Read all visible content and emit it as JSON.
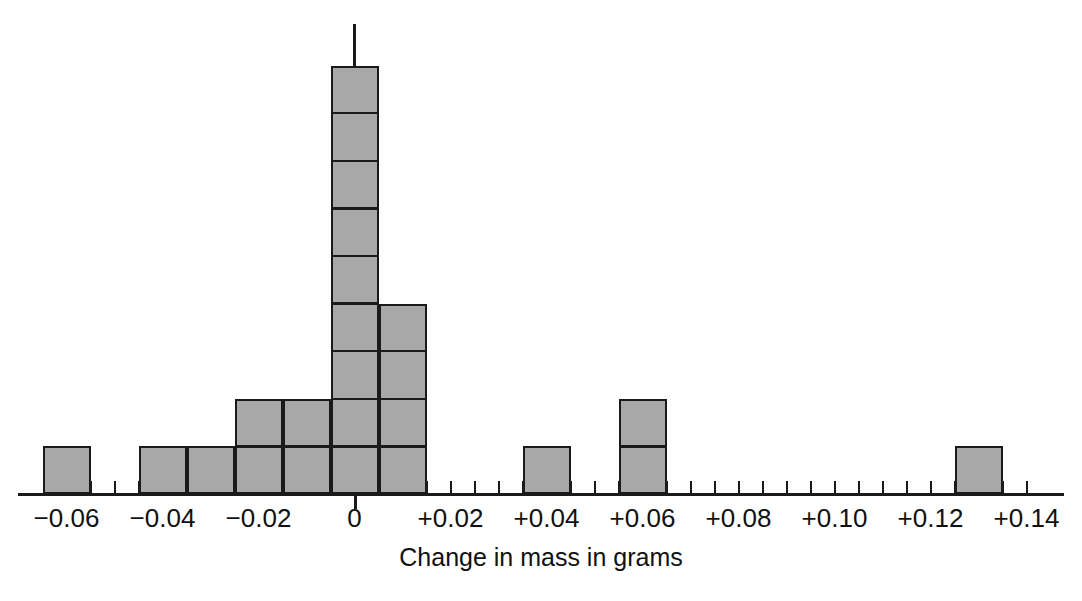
{
  "chart_data": {
    "type": "bar",
    "title": "",
    "xlabel": "Change in mass in grams",
    "ylabel": "",
    "grid": false,
    "legend": null,
    "bin_width": 0.01,
    "unit": "count",
    "xlim": [
      -0.07,
      0.145
    ],
    "ylim": [
      0,
      9
    ],
    "tick_values": [
      -0.06,
      -0.055,
      -0.05,
      -0.045,
      -0.04,
      -0.035,
      -0.03,
      -0.025,
      -0.02,
      -0.015,
      -0.01,
      -0.005,
      0,
      0.005,
      0.01,
      0.015,
      0.02,
      0.025,
      0.03,
      0.035,
      0.04,
      0.045,
      0.05,
      0.055,
      0.06,
      0.065,
      0.07,
      0.075,
      0.08,
      0.085,
      0.09,
      0.095,
      0.1,
      0.105,
      0.11,
      0.115,
      0.12,
      0.125,
      0.13,
      0.135,
      0.14
    ],
    "tick_labels": [
      {
        "value": -0.06,
        "text": "−0.06"
      },
      {
        "value": -0.04,
        "text": "−0.04"
      },
      {
        "value": -0.02,
        "text": "−0.02"
      },
      {
        "value": 0.0,
        "text": "0"
      },
      {
        "value": 0.02,
        "text": "+0.02"
      },
      {
        "value": 0.04,
        "text": "+0.04"
      },
      {
        "value": 0.06,
        "text": "+0.06"
      },
      {
        "value": 0.08,
        "text": "+0.08"
      },
      {
        "value": 0.1,
        "text": "+0.10"
      },
      {
        "value": 0.12,
        "text": "+0.12"
      },
      {
        "value": 0.14,
        "text": "+0.14"
      }
    ],
    "categories": [
      -0.06,
      -0.04,
      -0.03,
      -0.02,
      -0.01,
      0.0,
      0.01,
      0.04,
      0.06,
      0.13
    ],
    "values": [
      1,
      1,
      1,
      2,
      2,
      9,
      4,
      1,
      2,
      1
    ],
    "bars": [
      {
        "center": -0.06,
        "count": 1
      },
      {
        "center": -0.04,
        "count": 1
      },
      {
        "center": -0.03,
        "count": 1
      },
      {
        "center": -0.02,
        "count": 2
      },
      {
        "center": -0.01,
        "count": 2
      },
      {
        "center": 0.0,
        "count": 9
      },
      {
        "center": 0.01,
        "count": 4
      },
      {
        "center": 0.04,
        "count": 1
      },
      {
        "center": 0.06,
        "count": 2
      },
      {
        "center": 0.13,
        "count": 1
      }
    ],
    "total_count": 24,
    "colors": {
      "bar_fill": "#a8a8a8",
      "bar_stroke": "#1a1a1a",
      "axis": "#1a1a1a",
      "text": "#111111",
      "background": "#ffffff"
    }
  }
}
